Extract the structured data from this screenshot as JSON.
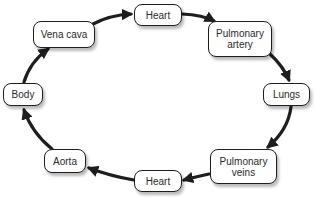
{
  "diagram": {
    "type": "cycle",
    "title": "",
    "nodes": [
      {
        "id": "heart_top",
        "label_lines": [
          "Heart"
        ]
      },
      {
        "id": "pulmonary_artery",
        "label_lines": [
          "Pulmonary",
          "artery"
        ]
      },
      {
        "id": "lungs",
        "label_lines": [
          "Lungs"
        ]
      },
      {
        "id": "pulmonary_veins",
        "label_lines": [
          "Pulmonary",
          "veins"
        ]
      },
      {
        "id": "heart_bottom",
        "label_lines": [
          "Heart"
        ]
      },
      {
        "id": "aorta",
        "label_lines": [
          "Aorta"
        ]
      },
      {
        "id": "body",
        "label_lines": [
          "Body"
        ]
      },
      {
        "id": "vena_cava",
        "label_lines": [
          "Vena cava"
        ]
      }
    ],
    "edges": [
      {
        "from": "vena_cava",
        "to": "heart_top"
      },
      {
        "from": "heart_top",
        "to": "pulmonary_artery"
      },
      {
        "from": "pulmonary_artery",
        "to": "lungs"
      },
      {
        "from": "lungs",
        "to": "pulmonary_veins"
      },
      {
        "from": "pulmonary_veins",
        "to": "heart_bottom"
      },
      {
        "from": "heart_bottom",
        "to": "aorta"
      },
      {
        "from": "aorta",
        "to": "body"
      },
      {
        "from": "body",
        "to": "vena_cava"
      }
    ],
    "colors": {
      "arrow": "#1e1e1e",
      "node_border": "#1e1e1e",
      "node_fill": "#ffffff",
      "text": "#2a2a2a"
    }
  }
}
